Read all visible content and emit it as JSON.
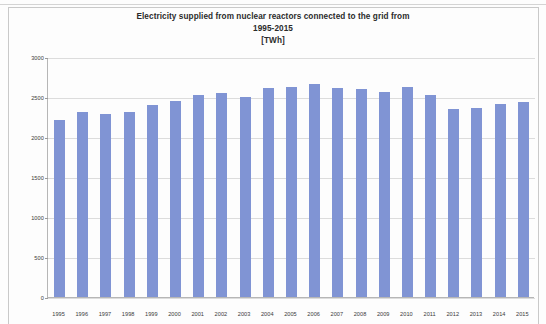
{
  "chart_data": {
    "type": "bar",
    "title": "Electricity supplied from nuclear reactors connected to the grid from",
    "subtitle": "1995-2015",
    "unit_label": "[TWh]",
    "xlabel": "",
    "ylabel": "",
    "ylim": [
      0,
      3000
    ],
    "ytick_labels": [
      "3000",
      "2500",
      "2000",
      "1500",
      "1000",
      "500",
      "0"
    ],
    "ytick_values": [
      3000,
      2500,
      2000,
      1500,
      1000,
      500,
      0
    ],
    "grid": true,
    "legend": false,
    "bar_color": "#8094d4",
    "categories": [
      "1995",
      "1996",
      "1997",
      "1998",
      "1999",
      "2000",
      "2001",
      "2002",
      "2003",
      "2004",
      "2005",
      "2006",
      "2007",
      "2008",
      "2009",
      "2010",
      "2011",
      "2012",
      "2013",
      "2014",
      "2015"
    ],
    "values": [
      2210,
      2310,
      2290,
      2310,
      2400,
      2450,
      2520,
      2550,
      2500,
      2615,
      2625,
      2660,
      2610,
      2600,
      2560,
      2630,
      2520,
      2345,
      2360,
      2410,
      2440
    ]
  }
}
